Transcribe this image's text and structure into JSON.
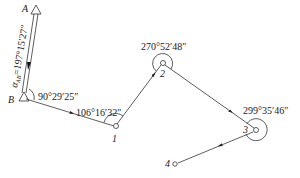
{
  "diagram": {
    "type": "traverse-survey",
    "stations": {
      "A": {
        "label": "A"
      },
      "B": {
        "label": "B"
      },
      "p1": {
        "label": "1"
      },
      "p2": {
        "label": "2"
      },
      "p3": {
        "label": "3"
      },
      "p4": {
        "label": "4"
      }
    },
    "azimuth_label": "α",
    "azimuth_sub": "AB",
    "azimuth_value": "=197°15′27″",
    "angles": {
      "B": "90°29′25″",
      "p1": "106°16′32″",
      "p2": "270°52′48″",
      "p3": "299°35′46″"
    }
  }
}
